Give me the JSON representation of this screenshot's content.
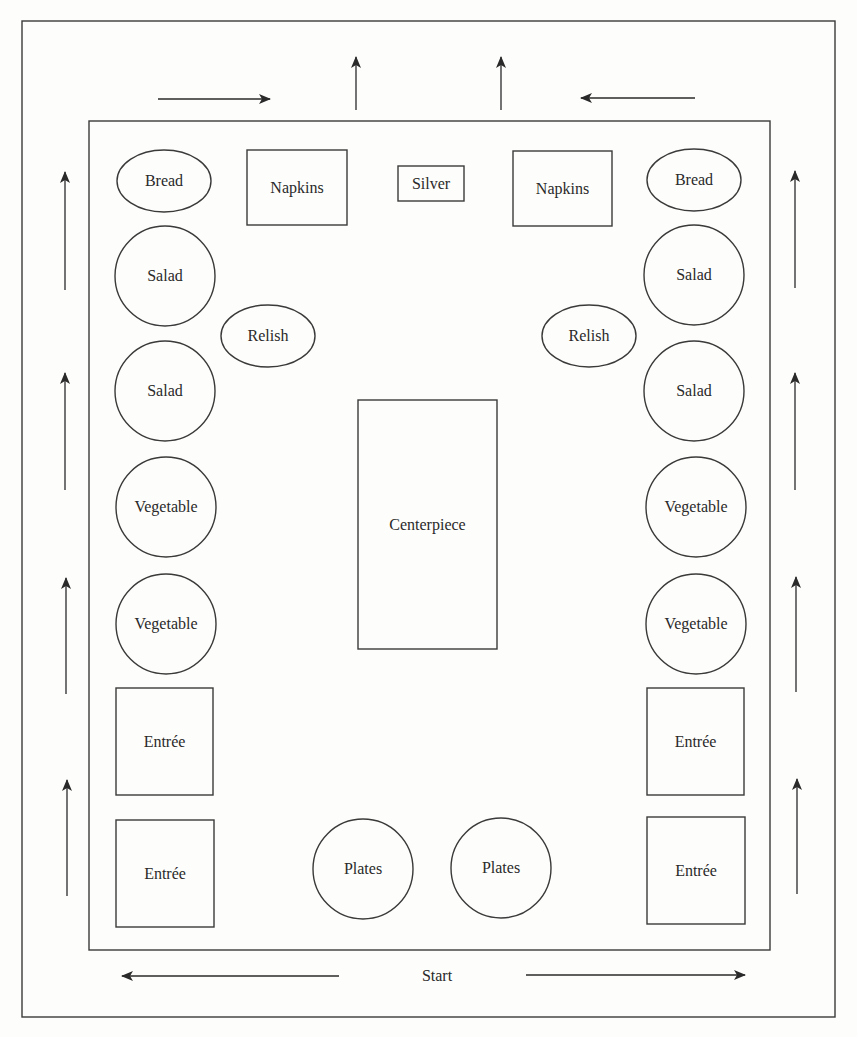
{
  "diagram": {
    "colors": {
      "stroke": "#3a3a3a",
      "text": "#2a2a2a",
      "background": "#fdfdfb"
    },
    "start_label": "Start",
    "outer_border": {
      "x": 22,
      "y": 21,
      "w": 813,
      "h": 996
    },
    "inner_table": {
      "x": 89,
      "y": 121,
      "w": 681,
      "h": 829
    },
    "items": [
      {
        "id": "bread-left",
        "label": "Bread",
        "shape": "ellipse",
        "cx": 164,
        "cy": 181,
        "rx": 47,
        "ry": 31
      },
      {
        "id": "napkins-left",
        "label": "Napkins",
        "shape": "rect",
        "x": 247,
        "y": 150,
        "w": 100,
        "h": 75
      },
      {
        "id": "silver",
        "label": "Silver",
        "shape": "rect",
        "x": 398,
        "y": 166,
        "w": 66,
        "h": 35
      },
      {
        "id": "napkins-right",
        "label": "Napkins",
        "shape": "rect",
        "x": 513,
        "y": 151,
        "w": 99,
        "h": 75
      },
      {
        "id": "bread-right",
        "label": "Bread",
        "shape": "ellipse",
        "cx": 694,
        "cy": 180,
        "rx": 47,
        "ry": 31
      },
      {
        "id": "salad-left-1",
        "label": "Salad",
        "shape": "circle",
        "cx": 165,
        "cy": 276,
        "r": 50
      },
      {
        "id": "salad-right-1",
        "label": "Salad",
        "shape": "circle",
        "cx": 694,
        "cy": 275,
        "r": 50
      },
      {
        "id": "relish-left",
        "label": "Relish",
        "shape": "ellipse",
        "cx": 268,
        "cy": 336,
        "rx": 47,
        "ry": 31
      },
      {
        "id": "relish-right",
        "label": "Relish",
        "shape": "ellipse",
        "cx": 589,
        "cy": 336,
        "rx": 47,
        "ry": 31
      },
      {
        "id": "salad-left-2",
        "label": "Salad",
        "shape": "circle",
        "cx": 165,
        "cy": 391,
        "r": 50
      },
      {
        "id": "salad-right-2",
        "label": "Salad",
        "shape": "circle",
        "cx": 694,
        "cy": 391,
        "r": 50
      },
      {
        "id": "centerpiece",
        "label": "Centerpiece",
        "shape": "rect",
        "x": 358,
        "y": 400,
        "w": 139,
        "h": 249
      },
      {
        "id": "vegetable-left-1",
        "label": "Vegetable",
        "shape": "circle",
        "cx": 166,
        "cy": 507,
        "r": 50
      },
      {
        "id": "vegetable-right-1",
        "label": "Vegetable",
        "shape": "circle",
        "cx": 696,
        "cy": 507,
        "r": 50
      },
      {
        "id": "vegetable-left-2",
        "label": "Vegetable",
        "shape": "circle",
        "cx": 166,
        "cy": 624,
        "r": 50
      },
      {
        "id": "vegetable-right-2",
        "label": "Vegetable",
        "shape": "circle",
        "cx": 696,
        "cy": 624,
        "r": 50
      },
      {
        "id": "entree-left-1",
        "label": "Entrée",
        "shape": "rect",
        "x": 116,
        "y": 688,
        "w": 97,
        "h": 107
      },
      {
        "id": "entree-right-1",
        "label": "Entrée",
        "shape": "rect",
        "x": 647,
        "y": 688,
        "w": 97,
        "h": 107
      },
      {
        "id": "entree-left-2",
        "label": "Entrée",
        "shape": "rect",
        "x": 116,
        "y": 820,
        "w": 98,
        "h": 107
      },
      {
        "id": "plates-left",
        "label": "Plates",
        "shape": "circle",
        "cx": 363,
        "cy": 869,
        "r": 50
      },
      {
        "id": "plates-right",
        "label": "Plates",
        "shape": "circle",
        "cx": 501,
        "cy": 868,
        "r": 50
      },
      {
        "id": "entree-right-2",
        "label": "Entrée",
        "shape": "rect",
        "x": 647,
        "y": 817,
        "w": 98,
        "h": 107
      }
    ],
    "arrows": [
      {
        "id": "top-right-arrow",
        "direction": "right",
        "x1": 158,
        "y1": 99,
        "x2": 270,
        "y2": 99
      },
      {
        "id": "top-up-arrow-left",
        "direction": "up",
        "x1": 356,
        "y1": 110,
        "x2": 356,
        "y2": 57
      },
      {
        "id": "top-up-arrow-right",
        "direction": "up",
        "x1": 501,
        "y1": 110,
        "x2": 501,
        "y2": 57
      },
      {
        "id": "top-left-arrow",
        "direction": "left",
        "x1": 695,
        "y1": 98,
        "x2": 581,
        "y2": 98
      },
      {
        "id": "left-up-arrow-1",
        "direction": "up",
        "x1": 65,
        "y1": 290,
        "x2": 65,
        "y2": 172
      },
      {
        "id": "left-up-arrow-2",
        "direction": "up",
        "x1": 65,
        "y1": 490,
        "x2": 65,
        "y2": 373
      },
      {
        "id": "left-up-arrow-3",
        "direction": "up",
        "x1": 66,
        "y1": 694,
        "x2": 66,
        "y2": 578
      },
      {
        "id": "left-up-arrow-4",
        "direction": "up",
        "x1": 67,
        "y1": 896,
        "x2": 67,
        "y2": 780
      },
      {
        "id": "right-up-arrow-1",
        "direction": "up",
        "x1": 795,
        "y1": 288,
        "x2": 795,
        "y2": 171
      },
      {
        "id": "right-up-arrow-2",
        "direction": "up",
        "x1": 795,
        "y1": 490,
        "x2": 795,
        "y2": 373
      },
      {
        "id": "right-up-arrow-3",
        "direction": "up",
        "x1": 796,
        "y1": 692,
        "x2": 796,
        "y2": 577
      },
      {
        "id": "right-up-arrow-4",
        "direction": "up",
        "x1": 797,
        "y1": 894,
        "x2": 797,
        "y2": 779
      },
      {
        "id": "bottom-left-arrow",
        "direction": "left",
        "x1": 339,
        "y1": 976,
        "x2": 122,
        "y2": 976
      },
      {
        "id": "bottom-right-arrow",
        "direction": "right",
        "x1": 526,
        "y1": 975,
        "x2": 745,
        "y2": 975
      }
    ],
    "start": {
      "x": 437,
      "y": 981
    }
  }
}
